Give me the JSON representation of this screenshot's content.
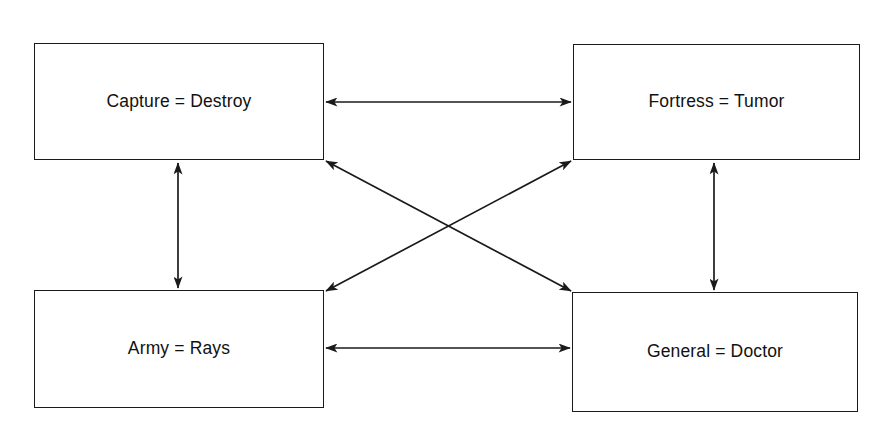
{
  "diagram": {
    "background_color": "#ffffff",
    "line_color": "#1a1a1a",
    "text_color": "#111111",
    "nodes": [
      {
        "id": "capture-destroy",
        "label": "Capture = Destroy",
        "source_term": "Capture",
        "target_term": "Destroy",
        "position": "top-left"
      },
      {
        "id": "fortress-tumor",
        "label": "Fortress = Tumor",
        "source_term": "Fortress",
        "target_term": "Tumor",
        "position": "top-right"
      },
      {
        "id": "army-rays",
        "label": "Army = Rays",
        "source_term": "Army",
        "target_term": "Rays",
        "position": "bottom-left"
      },
      {
        "id": "general-doctor",
        "label": "General = Doctor",
        "source_term": "General",
        "target_term": "Doctor",
        "position": "bottom-right"
      }
    ],
    "edges": [
      {
        "id": "top-horizontal",
        "from": "capture-destroy",
        "to": "fortress-tumor",
        "style": "double-arrow",
        "orientation": "horizontal"
      },
      {
        "id": "bottom-horizontal",
        "from": "army-rays",
        "to": "general-doctor",
        "style": "double-arrow",
        "orientation": "horizontal"
      },
      {
        "id": "left-vertical",
        "from": "capture-destroy",
        "to": "army-rays",
        "style": "double-arrow",
        "orientation": "vertical"
      },
      {
        "id": "right-vertical",
        "from": "fortress-tumor",
        "to": "general-doctor",
        "style": "double-arrow",
        "orientation": "vertical"
      },
      {
        "id": "diagonal-tl-br",
        "from": "capture-destroy",
        "to": "general-doctor",
        "style": "double-arrow",
        "orientation": "diagonal"
      },
      {
        "id": "diagonal-tr-bl",
        "from": "fortress-tumor",
        "to": "army-rays",
        "style": "double-arrow",
        "orientation": "diagonal"
      }
    ]
  }
}
